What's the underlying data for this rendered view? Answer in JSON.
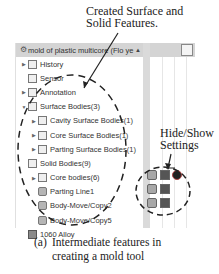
{
  "annotations": {
    "top_line1": "Created Surface and",
    "top_line2": "Solid Features.",
    "side_line1": "Hide/Show",
    "side_line2": "Settings"
  },
  "tree": {
    "header": {
      "icon": "part-icon",
      "title": "mold of plastic multicore  (Flo ye"
    },
    "items": [
      {
        "label": "History",
        "expandable": true,
        "icon": "history-folder-icon",
        "indent": 0
      },
      {
        "label": "Sensor",
        "expandable": false,
        "icon": "sensor-folder-icon",
        "indent": 0
      },
      {
        "label": "Annotation",
        "expandable": true,
        "icon": "annotation-folder-icon",
        "indent": 0
      },
      {
        "label": "Surface Bodies(3)",
        "expandable": true,
        "expanded": true,
        "icon": "surface-bodies-folder-icon",
        "indent": 0
      },
      {
        "label": "Cavity Surface Bodies(1)",
        "expandable": true,
        "icon": "surface-body-icon",
        "indent": 1
      },
      {
        "label": "Core Surface Bodies(1)",
        "expandable": true,
        "icon": "surface-body-icon",
        "indent": 1
      },
      {
        "label": "Parting Surface Bodies(1)",
        "expandable": true,
        "icon": "surface-body-icon",
        "indent": 1
      },
      {
        "label": "Solid Bodies(9)",
        "expandable": false,
        "expanded": true,
        "icon": "solid-bodies-folder-icon",
        "indent": 0
      },
      {
        "label": "Core bodies(6)",
        "expandable": true,
        "icon": "solid-body-folder-icon",
        "indent": 1
      },
      {
        "label": "Parting Line1",
        "expandable": false,
        "icon": "solid-body-icon",
        "indent": 1
      },
      {
        "label": "Body-Move/Copy2",
        "expandable": false,
        "icon": "solid-body-icon",
        "indent": 1
      },
      {
        "label": "Body-Move/Copy5",
        "expandable": false,
        "icon": "solid-body-icon",
        "indent": 1
      },
      {
        "label": "1060 Alloy",
        "expandable": false,
        "icon": "material-icon",
        "indent": 0
      }
    ]
  },
  "hide_show_icons": [
    {
      "name": "hide-show-body-icon-1",
      "style": "a"
    },
    {
      "name": "hide-show-body-icon-2",
      "style": "b"
    },
    {
      "name": "appearance-sphere-icon",
      "style": "c"
    },
    {
      "name": "hide-show-body-icon-3",
      "style": "a"
    },
    {
      "name": "hide-show-body-icon-4",
      "style": "b"
    },
    {
      "name": "hide-show-body-icon-5",
      "style": "a"
    },
    {
      "name": "hide-show-body-icon-6",
      "style": "b"
    }
  ],
  "caption": {
    "tag": "(a)",
    "line1": "Intermediate features in",
    "line2": "creating a mold tool"
  }
}
